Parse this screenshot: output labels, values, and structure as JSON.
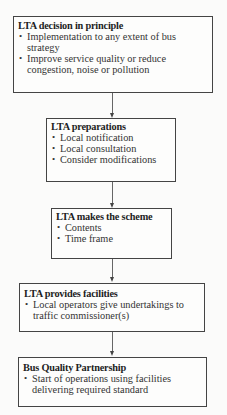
{
  "diagram": {
    "type": "flowchart",
    "direction": "top-to-bottom",
    "steps": [
      {
        "title": "LTA decision in principle",
        "bullets": [
          "Implementation to any extent of bus strategy",
          "Improve service quality or reduce congestion, noise or pollution"
        ]
      },
      {
        "title": "LTA preparations",
        "bullets": [
          "Local notification",
          "Local consultation",
          "Consider modifications"
        ]
      },
      {
        "title": "LTA makes the scheme",
        "bullets": [
          "Contents",
          "Time frame"
        ]
      },
      {
        "title": "LTA provides facilities",
        "bullets": [
          "Local operators give undertakings to traffic commissioner(s)"
        ]
      },
      {
        "title": "Bus Quality Partnership",
        "bullets": [
          "Start of operations using facilities delivering required standard"
        ]
      }
    ],
    "edges": [
      {
        "from": 0,
        "to": 1
      },
      {
        "from": 1,
        "to": 2
      },
      {
        "from": 2,
        "to": 3
      },
      {
        "from": 3,
        "to": 4
      }
    ]
  }
}
